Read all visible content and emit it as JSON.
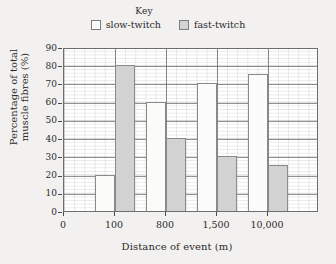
{
  "chart_data": {
    "type": "bar",
    "title": "",
    "xlabel": "Distance of event (m)",
    "ylabel": "Percentage of total muscle fibres (%)",
    "ylabel_line1": "Percentage of total",
    "ylabel_line2": "muscle fibres (%)",
    "categories": [
      "100",
      "800",
      "1,500",
      "10,000"
    ],
    "xtick_labels": [
      "0",
      "100",
      "800",
      "1,500",
      "10,000"
    ],
    "ytick_labels": [
      "0",
      "10",
      "20",
      "30",
      "40",
      "50",
      "60",
      "70",
      "80",
      "90"
    ],
    "ytick_values": [
      0,
      10,
      20,
      30,
      40,
      50,
      60,
      70,
      80,
      90
    ],
    "ylim": [
      0,
      90
    ],
    "grid": true,
    "grid_style": "graph-paper minor and major gridlines",
    "legend_position": "top-center",
    "series": [
      {
        "name": "slow-twitch",
        "color": "#fbfbfa",
        "values": [
          20,
          60,
          70,
          75
        ]
      },
      {
        "name": "fast-twitch",
        "color": "#d2d2d2",
        "values": [
          80,
          40,
          30,
          25
        ]
      }
    ]
  },
  "legend": {
    "title": "Key",
    "items": [
      {
        "label": "slow-twitch",
        "swatch": "#fbfbfa"
      },
      {
        "label": "fast-twitch",
        "swatch": "#d2d2d2"
      }
    ]
  },
  "colors": {
    "background": "#f2f1ef",
    "plot_background": "#ffffff",
    "axis": "#6e6e6e",
    "bar_slow_twitch": "#fbfbfa",
    "bar_fast_twitch": "#d2d2d2",
    "bar_outline": "#8a8a8a",
    "text": "#2b2b2b"
  }
}
